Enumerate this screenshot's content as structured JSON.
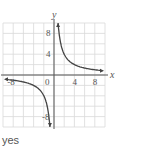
{
  "chart_data": {
    "type": "line",
    "title": "",
    "function": "y = 8/x",
    "xlabel": "x",
    "ylabel": "y",
    "xlim": [
      -10,
      10
    ],
    "ylim": [
      -10,
      10
    ],
    "grid": true,
    "grid_step": 2,
    "x_tick_labels": [
      "-8",
      "0",
      "4",
      "8"
    ],
    "y_tick_labels": [
      "8",
      "4",
      "-8"
    ],
    "series": [
      {
        "name": "branch-positive",
        "x": [
          0.8,
          1,
          2,
          4,
          8,
          9.5
        ],
        "y": [
          10,
          8,
          4,
          2,
          1,
          0.84
        ]
      },
      {
        "name": "branch-negative",
        "x": [
          -9.5,
          -8,
          -4,
          -2,
          -1,
          -0.8
        ],
        "y": [
          -0.84,
          -1,
          -2,
          -4,
          -8,
          -10
        ]
      }
    ],
    "colors": {
      "grid": "#d9d9d9",
      "axis": "#555555",
      "curve": "#444444"
    }
  },
  "answer": {
    "text": "yes"
  }
}
